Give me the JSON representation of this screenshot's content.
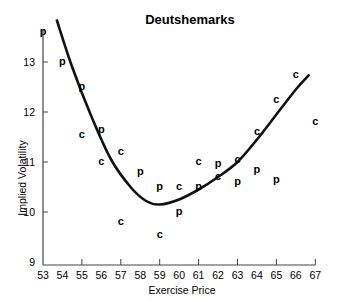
{
  "chart_data": {
    "type": "scatter",
    "title": "Deutshemarks",
    "xlabel": "Exercise Price",
    "ylabel": "Implied Volatility",
    "xlim": [
      53,
      67
    ],
    "ylim": [
      9,
      13.8
    ],
    "x_ticks": [
      53,
      54,
      55,
      56,
      57,
      58,
      59,
      60,
      61,
      62,
      63,
      64,
      65,
      66,
      67
    ],
    "x_major_ticks": [
      55,
      57,
      59,
      61,
      63,
      65,
      67
    ],
    "y_ticks": [
      9,
      10,
      11,
      12,
      13
    ],
    "grid": false,
    "legend": "none (markers labeled 'c' = calls, 'p' = puts)",
    "series": [
      {
        "name": "c",
        "marker": "c",
        "points": [
          [
            55,
            11.55
          ],
          [
            56,
            11.0
          ],
          [
            57,
            11.2
          ],
          [
            57,
            9.8
          ],
          [
            59,
            9.55
          ],
          [
            60,
            10.5
          ],
          [
            61,
            11.0
          ],
          [
            62,
            10.7
          ],
          [
            63,
            11.05
          ],
          [
            64,
            11.6
          ],
          [
            65,
            12.25
          ],
          [
            66,
            12.75
          ],
          [
            67,
            11.8
          ]
        ]
      },
      {
        "name": "p",
        "marker": "p",
        "points": [
          [
            53,
            13.6
          ],
          [
            54,
            13.0
          ],
          [
            55,
            12.5
          ],
          [
            56,
            11.65
          ],
          [
            58,
            10.8
          ],
          [
            59,
            10.5
          ],
          [
            60,
            10.0
          ],
          [
            61,
            10.5
          ],
          [
            62,
            10.97
          ],
          [
            63,
            10.6
          ],
          [
            64,
            10.85
          ],
          [
            65,
            10.65
          ]
        ]
      },
      {
        "name": "fitted smile",
        "type": "line",
        "points": [
          [
            53.7,
            13.85
          ],
          [
            54.5,
            12.9
          ],
          [
            55.5,
            11.9
          ],
          [
            56.5,
            11.05
          ],
          [
            57.5,
            10.5
          ],
          [
            58.3,
            10.22
          ],
          [
            59.0,
            10.15
          ],
          [
            60.0,
            10.25
          ],
          [
            61.0,
            10.45
          ],
          [
            62.0,
            10.7
          ],
          [
            63.0,
            11.0
          ],
          [
            64.0,
            11.45
          ],
          [
            65.0,
            11.95
          ],
          [
            66.0,
            12.45
          ],
          [
            66.7,
            12.75
          ]
        ]
      }
    ]
  }
}
